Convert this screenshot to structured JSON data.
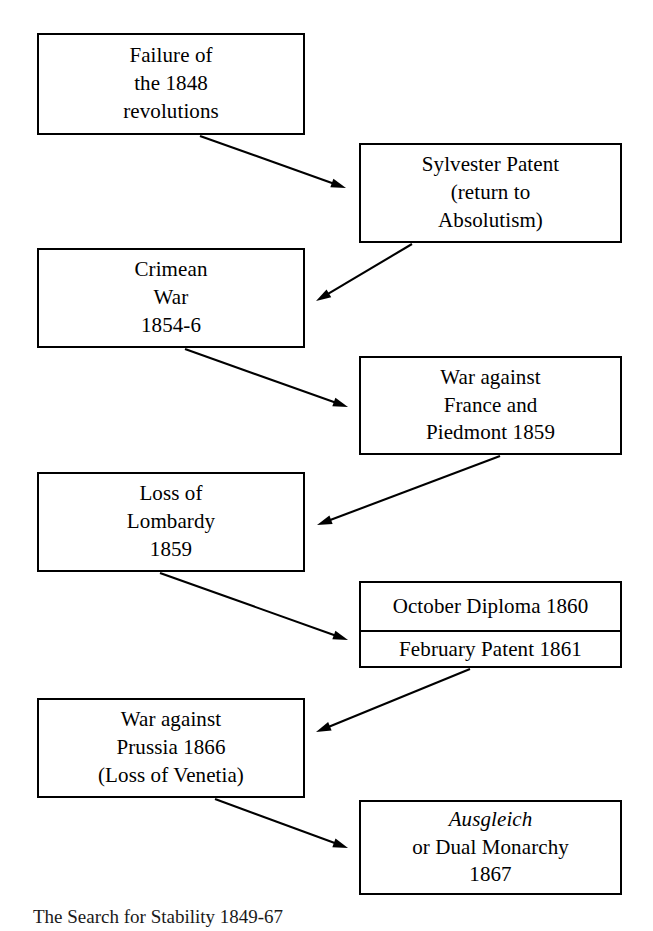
{
  "diagram": {
    "title": "The Search for Stability 1849-67",
    "type": "flowchart",
    "orientation": "zigzag-vertical",
    "border_color": "#000000",
    "background_color": "#ffffff",
    "nodes": [
      {
        "id": "failure-1848",
        "name": "failure-of-1848-revolutions",
        "column": "left",
        "lines": [
          "Failure of",
          "the 1848",
          "revolutions"
        ],
        "x": 37,
        "y": 33,
        "w": 268,
        "h": 102
      },
      {
        "id": "sylvester-patent",
        "name": "sylvester-patent",
        "column": "right",
        "lines": [
          "Sylvester Patent",
          "(return to",
          "Absolutism)"
        ],
        "x": 359,
        "y": 143,
        "w": 263,
        "h": 100
      },
      {
        "id": "crimean-war",
        "name": "crimean-war",
        "column": "left",
        "lines": [
          "Crimean",
          "War",
          "1854-6"
        ],
        "x": 37,
        "y": 248,
        "w": 268,
        "h": 100
      },
      {
        "id": "war-france-piedmont",
        "name": "war-against-france-and-piedmont",
        "column": "right",
        "lines": [
          "War against",
          "France and",
          "Piedmont 1859"
        ],
        "x": 359,
        "y": 356,
        "w": 263,
        "h": 99
      },
      {
        "id": "loss-lombardy",
        "name": "loss-of-lombardy",
        "column": "left",
        "lines": [
          "Loss of",
          "Lombardy",
          "1859"
        ],
        "x": 37,
        "y": 472,
        "w": 268,
        "h": 100
      },
      {
        "id": "diploma-patent",
        "name": "october-diploma-and-february-patent",
        "column": "right",
        "split": true,
        "top_text": "October Diploma 1860",
        "bottom_text": "February Patent 1861",
        "x": 359,
        "y": 581,
        "w": 263,
        "h": 87
      },
      {
        "id": "war-prussia",
        "name": "war-against-prussia",
        "column": "left",
        "lines": [
          "War against",
          "Prussia  1866",
          "(Loss of Venetia)"
        ],
        "x": 37,
        "y": 698,
        "w": 268,
        "h": 100
      },
      {
        "id": "ausgleich",
        "name": "ausgleich-dual-monarchy",
        "column": "right",
        "lines": [
          "Ausgleich",
          "or Dual Monarchy",
          "1867"
        ],
        "italic_lines": [
          0
        ],
        "x": 359,
        "y": 800,
        "w": 263,
        "h": 95
      }
    ],
    "arrows": [
      {
        "from": "failure-1848",
        "to": "sylvester-patent",
        "direction": "right-down",
        "x1": 200,
        "y1": 136,
        "x2": 346,
        "y2": 188
      },
      {
        "from": "sylvester-patent",
        "to": "crimean-war",
        "direction": "left-down",
        "x1": 412,
        "y1": 244,
        "x2": 316,
        "y2": 301
      },
      {
        "from": "crimean-war",
        "to": "war-france-piedmont",
        "direction": "right-down",
        "x1": 185,
        "y1": 349,
        "x2": 348,
        "y2": 407
      },
      {
        "from": "war-france-piedmont",
        "to": "loss-lombardy",
        "direction": "left-down",
        "x1": 500,
        "y1": 456,
        "x2": 317,
        "y2": 525
      },
      {
        "from": "loss-lombardy",
        "to": "diploma-patent",
        "direction": "right-down",
        "x1": 160,
        "y1": 573,
        "x2": 348,
        "y2": 640
      },
      {
        "from": "diploma-patent",
        "to": "war-prussia",
        "direction": "left-down",
        "x1": 470,
        "y1": 669,
        "x2": 316,
        "y2": 732
      },
      {
        "from": "war-prussia",
        "to": "ausgleich",
        "direction": "right-down",
        "x1": 215,
        "y1": 799,
        "x2": 348,
        "y2": 848
      }
    ]
  }
}
